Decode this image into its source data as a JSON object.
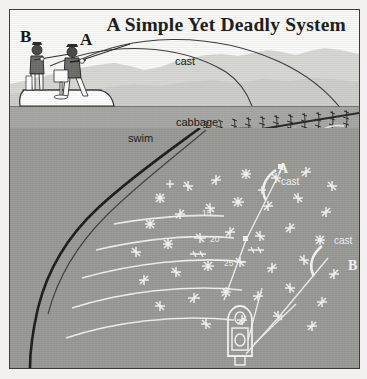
{
  "figure": {
    "title": "A Simple Yet Deadly System",
    "type": "instructional-fishing-illustration",
    "palette": {
      "paper": "#f2f1ef",
      "sky": "#fbfbfa",
      "hills": "#d6d6d3",
      "upper_water": "#a8a8a5",
      "underwater": "#9b9b98",
      "ink": "#1d1d1b",
      "white_line": "#f4f4f2",
      "frame": "#3a3a38"
    }
  },
  "labels": {
    "angler_b_top": "B",
    "angler_a_top": "A",
    "cast_top": "cast",
    "swim": "swim",
    "cabbage": "cabbage",
    "angler_a_plan": "A",
    "cast_a_plan": "cast",
    "angler_b_plan": "B",
    "cast_b_plan": "cast"
  },
  "depth_contours": [
    {
      "label": "15'",
      "value": 15,
      "unit": "feet"
    },
    {
      "label": "20'",
      "value": 20,
      "unit": "feet"
    },
    {
      "label": "25'",
      "value": 25,
      "unit": "feet"
    }
  ],
  "scene_elements": {
    "boat_side_view": "fishing-boat-with-two-anglers",
    "boat_plan_view": "fishing-boat-top-down-with-two-anglers",
    "fish_side_view": "pike-swimming-along-weedline",
    "fish_surface": "pike-near-cabbage-weed",
    "weeds": "cabbage-weed-bed",
    "drop_off": "bottom-contour-drop-off"
  }
}
